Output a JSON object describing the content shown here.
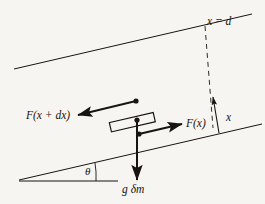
{
  "figure": {
    "background_color": "#f7f5f1",
    "ink_color": "#171412",
    "labels": {
      "position_d": "x = d",
      "force_left": "F(x + dx)",
      "force_right": "F(x)",
      "distance_x": "x",
      "angle": "θ",
      "gravity": "g δm"
    },
    "elements": {
      "upper_boundary": "upper-incline-line",
      "lower_boundary": "lower-incline-line",
      "horizontal_reference": "horizontal-baseline",
      "dashed_marker": "x-equals-d-dashed-line",
      "element_body": "fluid-element-rectangle",
      "arrow_left": "force-x-plus-dx-arrow",
      "arrow_right": "force-x-arrow",
      "arrow_down": "gravity-arrow",
      "arrow_measure": "distance-x-arrow",
      "angle_arc": "theta-angle-arc"
    }
  }
}
